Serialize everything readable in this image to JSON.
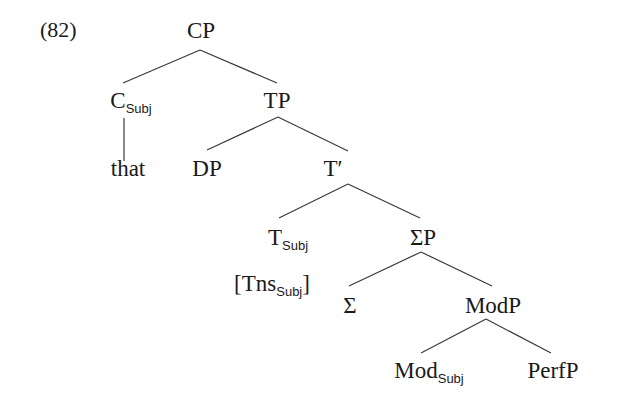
{
  "example": {
    "number": "(82)"
  },
  "tree": {
    "cp": {
      "label": "CP"
    },
    "c_subj": {
      "label": "C",
      "sub": "Subj"
    },
    "that": {
      "label": "that"
    },
    "tp": {
      "label": "TP"
    },
    "dp": {
      "label": "DP"
    },
    "t_bar": {
      "label": "T′"
    },
    "t_subj": {
      "label": "T",
      "sub": "Subj"
    },
    "tns_subj": {
      "label_open": "[Tns",
      "sub": "Subj",
      "label_close": "]"
    },
    "sigma_p": {
      "label": "ΣP"
    },
    "sigma": {
      "label": "Σ"
    },
    "mod_p": {
      "label": "ModP"
    },
    "mod_subj": {
      "label": "Mod",
      "sub": "Subj"
    },
    "perf_p": {
      "label": "PerfP"
    }
  },
  "edges": [
    [
      "CP",
      "C_Subj"
    ],
    [
      "CP",
      "TP"
    ],
    [
      "C_Subj",
      "that"
    ],
    [
      "TP",
      "DP"
    ],
    [
      "TP",
      "T′"
    ],
    [
      "T′",
      "T_Subj"
    ],
    [
      "T′",
      "ΣP"
    ],
    [
      "ΣP",
      "Σ"
    ],
    [
      "ΣP",
      "ModP"
    ],
    [
      "ModP",
      "Mod_Subj"
    ],
    [
      "ModP",
      "PerfP"
    ]
  ]
}
